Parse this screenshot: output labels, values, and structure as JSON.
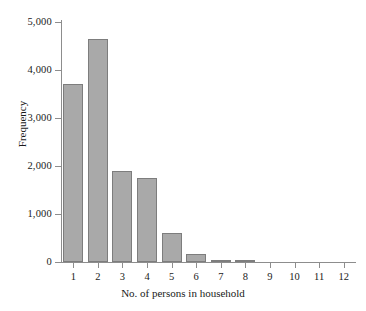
{
  "chart_data": {
    "type": "bar",
    "title": "",
    "xlabel": "No. of persons in household",
    "ylabel": "Frequency",
    "categories": [
      "1",
      "2",
      "3",
      "4",
      "5",
      "6",
      "7",
      "8",
      "9",
      "10",
      "11",
      "12"
    ],
    "values": [
      3700,
      4650,
      1900,
      1750,
      600,
      170,
      45,
      20,
      0,
      0,
      0,
      0
    ],
    "ylim": [
      0,
      5000
    ],
    "y_ticks": [
      0,
      1000,
      2000,
      3000,
      4000,
      5000
    ],
    "y_tick_labels": [
      "0",
      "1,000",
      "2,000",
      "3,000",
      "4,000",
      "5,000"
    ],
    "grid": false,
    "legend": false,
    "bar_color": "#a9a9a9",
    "bar_border_color": "#7d7d7d",
    "axis_color": "#8d8d8d",
    "text_color": "#1a1a1a",
    "background": "#ffffff"
  }
}
